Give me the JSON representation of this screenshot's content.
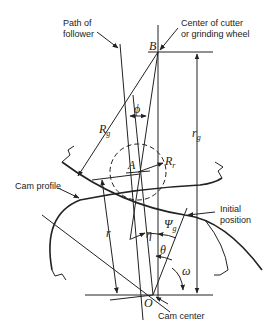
{
  "diagram": {
    "type": "cam-geometry",
    "labels": {
      "path_of_follower_line1": "Path of",
      "path_of_follower_line2": "follower",
      "center_cutter_line1": "Center of cutter",
      "center_cutter_line2": "or grinding wheel",
      "cam_profile": "Cam profile",
      "initial_line1": "Initial",
      "initial_line2": "position",
      "cam_center": "Cam center"
    },
    "points": {
      "B": "B",
      "A": "A",
      "O": "O"
    },
    "symbols": {
      "phi": "ϕ",
      "R_main": "R",
      "R_g_sub": "g",
      "R_r_sub": "r",
      "r_g_main": "r",
      "r_g_sub": "g",
      "r": "r",
      "eta": "η",
      "theta": "θ",
      "psi_main": "Ψ",
      "psi_sub": "g",
      "omega": "ω"
    },
    "colors": {
      "line": "#222222",
      "background": "#ffffff"
    }
  }
}
